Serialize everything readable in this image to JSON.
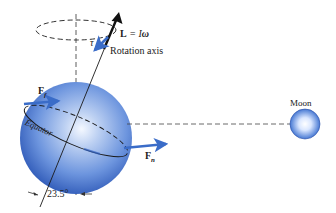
{
  "diagram": {
    "type": "physics-diagram",
    "labels": {
      "angular_momentum": "L = Iω",
      "angular_momentum_L": "L",
      "angular_momentum_eq": " = I",
      "angular_momentum_omega": "ω",
      "torque": "τ",
      "rotation_axis": "Rotation axis",
      "force_far": "F",
      "force_far_sub": "f",
      "force_near": "F",
      "force_near_sub": "n",
      "equator": "Equator",
      "moon": "Moon",
      "tilt_angle": "23.5°"
    },
    "colors": {
      "earth_light": "#eef4ff",
      "earth_mid": "#6f98e0",
      "earth_dark": "#2b57b8",
      "arrow_blue": "#3a6cc8",
      "line": "#222222",
      "axis_arrow": "#111111"
    },
    "tilt_degrees": 23.5
  }
}
